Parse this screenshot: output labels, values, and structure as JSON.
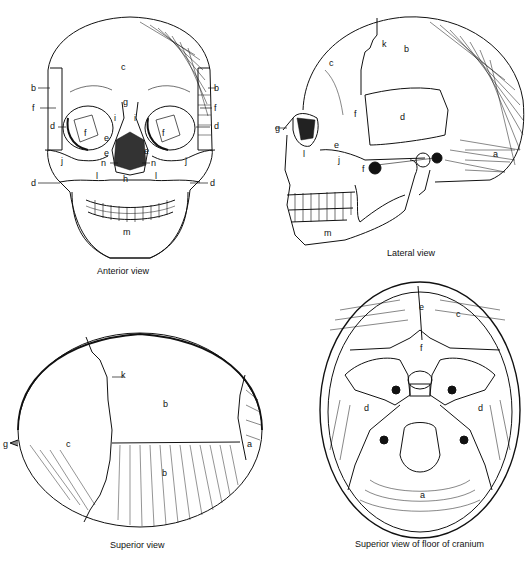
{
  "figure": {
    "panels": [
      {
        "id": "anterior",
        "caption": "Anterior view",
        "labels": {
          "c": "c",
          "b_left": "b",
          "b_right": "b",
          "f_left": "f",
          "f_right": "f",
          "d_left": "d",
          "d_right": "d",
          "g": "g",
          "i_left": "i",
          "i_right": "i",
          "f_orbit_left": "f",
          "f_orbit_right": "f",
          "e_left": "e",
          "e_right": "e",
          "e_orbit": "e",
          "j_left": "j",
          "j_right": "j",
          "n_left": "n",
          "n_right": "n",
          "l_left": "l",
          "l_right": "l",
          "h": "h",
          "d_low_left": "d",
          "d_low_right": "d",
          "m": "m"
        }
      },
      {
        "id": "lateral",
        "caption": "Lateral view",
        "labels": {
          "k": "k",
          "b": "b",
          "c": "c",
          "f": "f",
          "d": "d",
          "g": "g",
          "e": "e",
          "l": "l",
          "j": "j",
          "f_lower": "f",
          "a": "a",
          "m": "m"
        }
      },
      {
        "id": "superior",
        "caption": "Superior view",
        "labels": {
          "k": "k",
          "b_top": "b",
          "c": "c",
          "g": "g",
          "a": "a",
          "b_bottom": "b"
        }
      },
      {
        "id": "floor",
        "caption": "Superior view of floor of cranium",
        "labels": {
          "e": "e",
          "c": "c",
          "f": "f",
          "d_left": "d",
          "d_right": "d",
          "a": "a"
        }
      }
    ]
  }
}
